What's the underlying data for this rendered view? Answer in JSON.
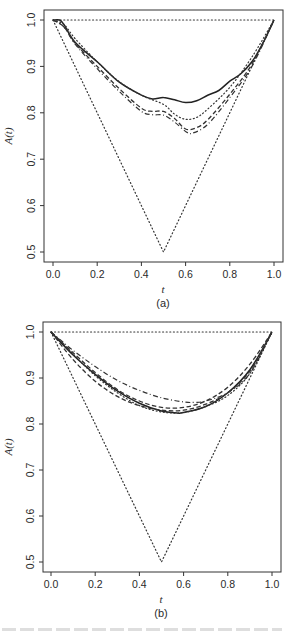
{
  "chart_data": [
    {
      "type": "line",
      "panel_label": "(a)",
      "xlabel": "t",
      "ylabel": "A(t)",
      "xlim": [
        0.0,
        1.0
      ],
      "ylim": [
        0.5,
        1.0
      ],
      "xticks": [
        "0.0",
        "0.2",
        "0.4",
        "0.6",
        "0.8",
        "1.0"
      ],
      "yticks": [
        "0.5",
        "0.6",
        "0.7",
        "0.8",
        "0.9",
        "1.0"
      ],
      "grid": false,
      "legend": "none",
      "series": [
        {
          "name": "bound-upper",
          "style": "dotted",
          "x": [
            0.0,
            1.0
          ],
          "y": [
            1.0,
            1.0
          ]
        },
        {
          "name": "bound-lower",
          "style": "dotted",
          "x": [
            0.0,
            0.5,
            1.0
          ],
          "y": [
            1.0,
            0.5,
            1.0
          ]
        },
        {
          "name": "estimate-solid",
          "style": "solid",
          "x": [
            0.0,
            0.03,
            0.05,
            0.1,
            0.2,
            0.3,
            0.4,
            0.45,
            0.5,
            0.55,
            0.6,
            0.65,
            0.7,
            0.75,
            0.8,
            0.85,
            0.9,
            0.95,
            1.0
          ],
          "y": [
            1.0,
            1.0,
            0.99,
            0.952,
            0.91,
            0.866,
            0.838,
            0.83,
            0.833,
            0.828,
            0.822,
            0.826,
            0.838,
            0.848,
            0.868,
            0.884,
            0.91,
            0.95,
            1.0
          ]
        },
        {
          "name": "estimate-dotted",
          "style": "dotted",
          "x": [
            0.0,
            0.05,
            0.1,
            0.2,
            0.3,
            0.4,
            0.5,
            0.55,
            0.6,
            0.65,
            0.7,
            0.8,
            0.9,
            1.0
          ],
          "y": [
            1.0,
            0.99,
            0.96,
            0.91,
            0.867,
            0.838,
            0.818,
            0.797,
            0.786,
            0.79,
            0.808,
            0.855,
            0.92,
            1.0
          ]
        },
        {
          "name": "estimate-dashed",
          "style": "dashed",
          "x": [
            0.0,
            0.05,
            0.1,
            0.2,
            0.3,
            0.4,
            0.45,
            0.5,
            0.55,
            0.6,
            0.65,
            0.7,
            0.8,
            0.9,
            1.0
          ],
          "y": [
            1.0,
            0.985,
            0.95,
            0.9,
            0.852,
            0.81,
            0.803,
            0.803,
            0.788,
            0.765,
            0.768,
            0.785,
            0.84,
            0.905,
            1.0
          ]
        },
        {
          "name": "estimate-dotdash",
          "style": "dotdash",
          "x": [
            0.0,
            0.05,
            0.1,
            0.2,
            0.3,
            0.4,
            0.45,
            0.5,
            0.55,
            0.6,
            0.63,
            0.7,
            0.8,
            0.9,
            1.0
          ],
          "y": [
            1.0,
            0.985,
            0.948,
            0.895,
            0.846,
            0.803,
            0.796,
            0.795,
            0.78,
            0.76,
            0.756,
            0.775,
            0.833,
            0.9,
            1.0
          ]
        }
      ]
    },
    {
      "type": "line",
      "panel_label": "(b)",
      "xlabel": "t",
      "ylabel": "A(t)",
      "xlim": [
        0.0,
        1.0
      ],
      "ylim": [
        0.5,
        1.0
      ],
      "xticks": [
        "0.0",
        "0.2",
        "0.4",
        "0.6",
        "0.8",
        "1.0"
      ],
      "yticks": [
        "0.5",
        "0.6",
        "0.7",
        "0.8",
        "0.9",
        "1.0"
      ],
      "grid": false,
      "legend": "none",
      "series": [
        {
          "name": "bound-upper",
          "style": "dotted",
          "x": [
            0.0,
            1.0
          ],
          "y": [
            1.0,
            1.0
          ]
        },
        {
          "name": "bound-lower",
          "style": "dotted",
          "x": [
            0.0,
            0.5,
            1.0
          ],
          "y": [
            1.0,
            0.5,
            1.0
          ]
        },
        {
          "name": "fit-solid",
          "style": "solid",
          "x": [
            0.0,
            0.1,
            0.2,
            0.3,
            0.4,
            0.5,
            0.57,
            0.6,
            0.7,
            0.8,
            0.9,
            1.0
          ],
          "y": [
            1.0,
            0.95,
            0.908,
            0.872,
            0.845,
            0.828,
            0.824,
            0.825,
            0.838,
            0.868,
            0.918,
            1.0
          ]
        },
        {
          "name": "fit-dotdash",
          "style": "dotdash",
          "x": [
            0.0,
            0.1,
            0.2,
            0.3,
            0.4,
            0.5,
            0.6,
            0.65,
            0.7,
            0.8,
            0.9,
            1.0
          ],
          "y": [
            1.0,
            0.96,
            0.925,
            0.895,
            0.873,
            0.857,
            0.848,
            0.847,
            0.85,
            0.868,
            0.91,
            1.0
          ]
        },
        {
          "name": "fit-dashed-upper",
          "style": "dashed",
          "x": [
            0.0,
            0.1,
            0.2,
            0.3,
            0.4,
            0.5,
            0.6,
            0.7,
            0.8,
            0.9,
            1.0
          ],
          "y": [
            1.0,
            0.955,
            0.912,
            0.875,
            0.85,
            0.836,
            0.836,
            0.85,
            0.88,
            0.93,
            1.0
          ]
        },
        {
          "name": "fit-dashed-lower",
          "style": "dashed",
          "x": [
            0.0,
            0.1,
            0.2,
            0.3,
            0.4,
            0.5,
            0.6,
            0.7,
            0.8,
            0.9,
            1.0
          ],
          "y": [
            1.0,
            0.94,
            0.893,
            0.86,
            0.84,
            0.83,
            0.83,
            0.843,
            0.868,
            0.915,
            1.0
          ]
        },
        {
          "name": "fit-dotted",
          "style": "dotted",
          "x": [
            0.0,
            0.1,
            0.2,
            0.3,
            0.4,
            0.5,
            0.6,
            0.7,
            0.8,
            0.9,
            1.0
          ],
          "y": [
            1.0,
            0.952,
            0.905,
            0.868,
            0.84,
            0.826,
            0.825,
            0.838,
            0.862,
            0.91,
            1.0
          ]
        }
      ]
    }
  ],
  "panels": [
    {
      "label": "(a)",
      "xlabel": "t",
      "ylabel": "A(t)"
    },
    {
      "label": "(b)",
      "xlabel": "t",
      "ylabel": "A(t)"
    }
  ]
}
